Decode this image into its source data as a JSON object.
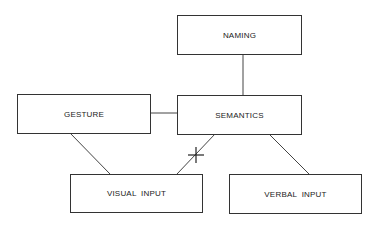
{
  "nodes": {
    "naming": "NAMING",
    "semantics": "SEMANTICS",
    "gesture": "GESTURE",
    "visual_input": "VISUAL  INPUT",
    "verbal_input": "VERBAL  INPUT"
  },
  "edges": [
    {
      "from": "naming",
      "to": "semantics"
    },
    {
      "from": "gesture",
      "to": "semantics"
    },
    {
      "from": "gesture",
      "to": "visual_input"
    },
    {
      "from": "semantics",
      "to": "visual_input",
      "marker": "cross (disconnection)"
    },
    {
      "from": "semantics",
      "to": "verbal_input"
    }
  ]
}
